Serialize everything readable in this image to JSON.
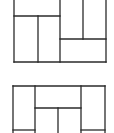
{
  "diagram": {
    "type": "rectangle-tiling-puzzle",
    "figures": [
      {
        "id": "top",
        "bounds": {
          "x": 14,
          "y": 0,
          "w": 92,
          "h": 62
        },
        "note": "outer frame cropped at top; left area split by horizontal line at y=16 with two columns below, right area has two tall columns over a wide bottom rectangle"
      },
      {
        "id": "bottom",
        "bounds": {
          "x": 13,
          "y": 86,
          "w": 92,
          "h": 47
        },
        "note": "left and right tall columns, center top wide rectangle over two columns; cropped at bottom"
      }
    ],
    "stroke_color": "#2a2a2a",
    "background": "#ffffff"
  }
}
